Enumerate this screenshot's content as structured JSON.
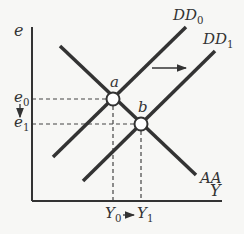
{
  "diagram": {
    "colors": {
      "line": "#333333",
      "background": "#f7f7f5",
      "dash": "#444444"
    },
    "axes": {
      "y_label": "e",
      "x_label": "Y",
      "origin": [
        32,
        201
      ],
      "y_top": 27,
      "x_right": 222
    },
    "curves": [
      {
        "name": "AA",
        "label": "AA",
        "from": [
          60,
          46
        ],
        "to": [
          196,
          175
        ],
        "label_pos": [
          200,
          183
        ]
      },
      {
        "name": "DD0",
        "label_main": "DD",
        "label_sub": "0",
        "from": [
          53,
          157
        ],
        "to": [
          186,
          27
        ],
        "label_pos": [
          173,
          20
        ]
      },
      {
        "name": "DD1",
        "label_main": "DD",
        "label_sub": "1",
        "from": [
          83,
          181
        ],
        "to": [
          215,
          51
        ],
        "label_pos": [
          203,
          44
        ]
      }
    ],
    "points": [
      {
        "name": "a",
        "label": "a",
        "x": 113,
        "y": 99,
        "label_pos": [
          110,
          87
        ]
      },
      {
        "name": "b",
        "label": "b",
        "x": 141,
        "y": 124,
        "label_pos": [
          138,
          112
        ]
      }
    ],
    "y_ticks": [
      {
        "main": "e",
        "sub": "0",
        "y": 99
      },
      {
        "main": "e",
        "sub": "1",
        "y": 124
      }
    ],
    "x_ticks": [
      {
        "main": "Y",
        "sub": "0",
        "x": 113
      },
      {
        "main": "Y",
        "sub": "1",
        "x": 141
      }
    ],
    "shift_arrow": {
      "from": [
        152,
        68
      ],
      "to": [
        186,
        68
      ],
      "meaning": "DD shifts right"
    },
    "e_arrow": {
      "from": [
        20,
        104
      ],
      "to": [
        20,
        117
      ],
      "meaning": "e falls from e0 to e1"
    },
    "y_arrow": {
      "from": [
        123,
        215
      ],
      "to": [
        134,
        215
      ],
      "meaning": "Y rises from Y0 to Y1"
    }
  }
}
